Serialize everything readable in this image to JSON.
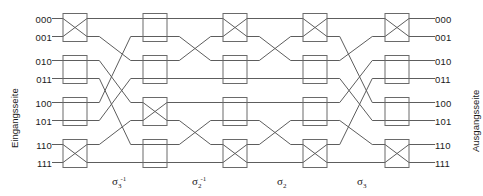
{
  "figure": {
    "type": "benes-network-diagram",
    "input_side_label": "Eingangsseite",
    "output_side_label": "Ausgangsseite",
    "input_labels": [
      "000",
      "001",
      "010",
      "011",
      "100",
      "101",
      "110",
      "111"
    ],
    "output_labels": [
      "000",
      "001",
      "010",
      "011",
      "100",
      "101",
      "110",
      "111"
    ],
    "stage_labels": [
      {
        "sigma": "σ",
        "sub": "3",
        "sup": "-1",
        "text": "σ₃⁻¹"
      },
      {
        "sigma": "σ",
        "sub": "2",
        "sup": "-1",
        "text": "σ₂⁻¹"
      },
      {
        "sigma": "σ",
        "sub": "2",
        "sup": "",
        "text": "σ₂"
      },
      {
        "sigma": "σ",
        "sub": "3",
        "sup": "",
        "text": "σ₃"
      }
    ],
    "columns": [
      {
        "name": "column-1",
        "switches": [
          "cross",
          "bar",
          "bar",
          "cross"
        ]
      },
      {
        "name": "column-2",
        "switches": [
          "bar",
          "bar",
          "cross",
          "bar"
        ]
      },
      {
        "name": "column-3",
        "switches": [
          "cross",
          "bar",
          "bar",
          "cross"
        ]
      },
      {
        "name": "column-4",
        "switches": [
          "cross",
          "bar",
          "bar",
          "cross"
        ]
      },
      {
        "name": "column-5",
        "switches": [
          "cross",
          "bar",
          "bar",
          "cross"
        ]
      }
    ],
    "permutations": [
      {
        "name": "sigma3-inverse",
        "map": [
          0,
          2,
          4,
          6,
          1,
          3,
          5,
          7
        ]
      },
      {
        "name": "sigma2-inverse",
        "map": [
          0,
          2,
          1,
          3,
          4,
          6,
          5,
          7
        ]
      },
      {
        "name": "sigma2",
        "map": [
          0,
          2,
          1,
          3,
          4,
          6,
          5,
          7
        ]
      },
      {
        "name": "sigma3",
        "map": [
          0,
          4,
          1,
          5,
          2,
          6,
          3,
          7
        ]
      }
    ],
    "colors": {
      "wire": "#5d5d5d",
      "box_stroke": "#6a6a6a",
      "text": "#1a1a1a",
      "background": "#ffffff"
    }
  }
}
